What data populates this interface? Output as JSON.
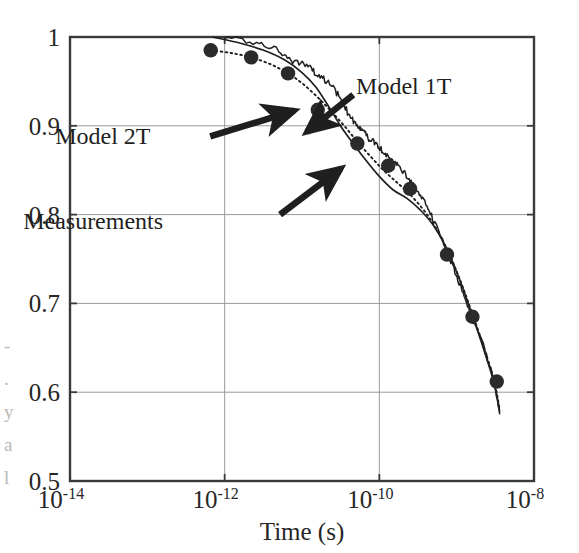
{
  "figure": {
    "background_color": "#ffffff",
    "plot_border_color": "#3a3a3a",
    "grid_color": "#9a9a9a",
    "ink_color": "#1f1f1f",
    "marker_color": "#2b2b2b"
  },
  "chart_data": {
    "type": "line",
    "title": "",
    "subtitle": "",
    "xlabel": "Time (s)",
    "ylabel": "",
    "x_scale": "log",
    "y_scale": "linear",
    "xlim": [
      1e-14,
      1e-08
    ],
    "ylim": [
      0.5,
      1.0
    ],
    "grid": true,
    "legend_position": "inline-annotations",
    "x_tick_labels": [
      "10",
      "10",
      "10",
      "10"
    ],
    "x_tick_exponents": [
      "-14",
      "-12",
      "-10",
      "-8"
    ],
    "x_tick_values": [
      1e-14,
      1e-12,
      1e-10,
      1e-08
    ],
    "y_tick_labels": [
      "1",
      "0.9",
      "0.8",
      "0.7",
      "0.6",
      "0.5"
    ],
    "y_tick_values": [
      1.0,
      0.9,
      0.8,
      0.7,
      0.6,
      0.5
    ],
    "annotations": [
      {
        "label": "Model 1T",
        "label_x": 5e-11,
        "label_y": 0.945,
        "arrow_from_x": 4.6e-11,
        "arrow_from_y": 0.935,
        "arrow_to_x": 1.15e-11,
        "arrow_to_y": 0.893
      },
      {
        "label": "Model 2T",
        "label_x": 1.1e-13,
        "label_y": 0.888,
        "arrow_from_x": 6.5e-13,
        "arrow_from_y": 0.888,
        "arrow_to_x": 8e-12,
        "arrow_to_y": 0.917
      },
      {
        "label": "Measurements",
        "label_x": 1.6e-13,
        "label_y": 0.793,
        "arrow_from_x": 5.2e-12,
        "arrow_from_y": 0.8,
        "arrow_to_x": 3.2e-11,
        "arrow_to_y": 0.852
      }
    ],
    "series": [
      {
        "name": "Measurements",
        "style": "markers",
        "marker": "filled-circle",
        "points": [
          {
            "x": 6.6e-13,
            "y": 0.985
          },
          {
            "x": 2.2e-12,
            "y": 0.977
          },
          {
            "x": 6.6e-12,
            "y": 0.959
          },
          {
            "x": 1.6e-11,
            "y": 0.918
          },
          {
            "x": 5.2e-11,
            "y": 0.88
          },
          {
            "x": 1.3e-10,
            "y": 0.855
          },
          {
            "x": 2.5e-10,
            "y": 0.829
          },
          {
            "x": 7.5e-10,
            "y": 0.755
          },
          {
            "x": 1.6e-09,
            "y": 0.685
          },
          {
            "x": 3.3e-09,
            "y": 0.612
          }
        ]
      },
      {
        "name": "Measurements trace",
        "style": "noisy-solid-line",
        "points": [
          {
            "x": 1e-12,
            "y": 1.0
          },
          {
            "x": 2.6e-12,
            "y": 0.995
          },
          {
            "x": 5e-12,
            "y": 0.983
          },
          {
            "x": 8e-12,
            "y": 0.973
          },
          {
            "x": 1.2e-11,
            "y": 0.968
          },
          {
            "x": 1.6e-11,
            "y": 0.957
          },
          {
            "x": 2.2e-11,
            "y": 0.95
          },
          {
            "x": 3e-11,
            "y": 0.933
          },
          {
            "x": 4e-11,
            "y": 0.913
          },
          {
            "x": 5.2e-11,
            "y": 0.9
          },
          {
            "x": 6e-11,
            "y": 0.897
          },
          {
            "x": 7.5e-11,
            "y": 0.885
          },
          {
            "x": 9e-11,
            "y": 0.88
          },
          {
            "x": 1.1e-10,
            "y": 0.871
          },
          {
            "x": 1.4e-10,
            "y": 0.862
          },
          {
            "x": 1.8e-10,
            "y": 0.855
          },
          {
            "x": 2.3e-10,
            "y": 0.842
          },
          {
            "x": 3e-10,
            "y": 0.828
          },
          {
            "x": 4e-10,
            "y": 0.81
          },
          {
            "x": 5.4e-10,
            "y": 0.79
          },
          {
            "x": 7.2e-10,
            "y": 0.762
          },
          {
            "x": 9.5e-10,
            "y": 0.735
          },
          {
            "x": 1.25e-09,
            "y": 0.707
          },
          {
            "x": 1.7e-09,
            "y": 0.678
          },
          {
            "x": 2.3e-09,
            "y": 0.648
          },
          {
            "x": 3e-09,
            "y": 0.615
          },
          {
            "x": 3.6e-09,
            "y": 0.575
          }
        ]
      },
      {
        "name": "Model 2T",
        "style": "solid-line",
        "points": [
          {
            "x": 7e-13,
            "y": 1.0
          },
          {
            "x": 1.6e-12,
            "y": 0.993
          },
          {
            "x": 3.2e-12,
            "y": 0.985
          },
          {
            "x": 6e-12,
            "y": 0.974
          },
          {
            "x": 1e-11,
            "y": 0.96
          },
          {
            "x": 1.5e-11,
            "y": 0.944
          },
          {
            "x": 2.2e-11,
            "y": 0.922
          },
          {
            "x": 3.2e-11,
            "y": 0.899
          },
          {
            "x": 4.6e-11,
            "y": 0.88
          },
          {
            "x": 6.6e-11,
            "y": 0.862
          },
          {
            "x": 1e-10,
            "y": 0.843
          },
          {
            "x": 1.5e-10,
            "y": 0.828
          },
          {
            "x": 2.3e-10,
            "y": 0.818
          },
          {
            "x": 3.4e-10,
            "y": 0.805
          },
          {
            "x": 5e-10,
            "y": 0.788
          },
          {
            "x": 7.4e-10,
            "y": 0.762
          },
          {
            "x": 1.1e-09,
            "y": 0.726
          },
          {
            "x": 1.6e-09,
            "y": 0.686
          },
          {
            "x": 2.3e-09,
            "y": 0.645
          },
          {
            "x": 3.1e-09,
            "y": 0.608
          },
          {
            "x": 3.6e-09,
            "y": 0.578
          }
        ]
      },
      {
        "name": "Model 1T",
        "style": "dotted-line",
        "points": [
          {
            "x": 6.6e-13,
            "y": 0.985
          },
          {
            "x": 1.2e-12,
            "y": 0.982
          },
          {
            "x": 2.2e-12,
            "y": 0.977
          },
          {
            "x": 4e-12,
            "y": 0.969
          },
          {
            "x": 6.6e-12,
            "y": 0.959
          },
          {
            "x": 1e-11,
            "y": 0.948
          },
          {
            "x": 1.6e-11,
            "y": 0.932
          },
          {
            "x": 2.4e-11,
            "y": 0.916
          },
          {
            "x": 3.6e-11,
            "y": 0.899
          },
          {
            "x": 5.2e-11,
            "y": 0.882
          },
          {
            "x": 7.6e-11,
            "y": 0.866
          },
          {
            "x": 1.1e-10,
            "y": 0.851
          },
          {
            "x": 1.6e-10,
            "y": 0.838
          },
          {
            "x": 2.4e-10,
            "y": 0.824
          },
          {
            "x": 3.6e-10,
            "y": 0.807
          },
          {
            "x": 5.2e-10,
            "y": 0.787
          },
          {
            "x": 7.6e-10,
            "y": 0.76
          },
          {
            "x": 1.1e-09,
            "y": 0.727
          },
          {
            "x": 1.6e-09,
            "y": 0.688
          },
          {
            "x": 2.3e-09,
            "y": 0.648
          },
          {
            "x": 3.1e-09,
            "y": 0.61
          },
          {
            "x": 3.6e-09,
            "y": 0.58
          }
        ]
      }
    ]
  },
  "edge_fragments": [
    "-",
    ".",
    "y",
    "a",
    "l"
  ]
}
